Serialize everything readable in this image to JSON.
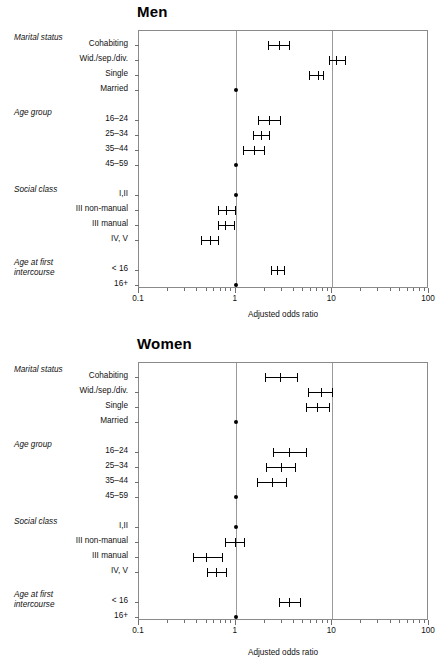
{
  "figure": {
    "axis_title": "Adjusted odds ratio",
    "x_ticklabels": [
      "0.1",
      "1",
      "10",
      "100"
    ],
    "x_tickvalues": [
      0.1,
      1,
      10,
      100
    ],
    "group_labels": {
      "marital": "Marital status",
      "age_group": "Age group",
      "social_class": "Social class",
      "age_first": "Age at first intercourse"
    },
    "row_labels": [
      "Cohabiting",
      "Wid./sep./div.",
      "Single",
      "Married",
      "16–24",
      "25–34",
      "35–44",
      "45–59",
      "I,II",
      "III non-manual",
      "III manual",
      "IV, V",
      "< 16",
      "16+"
    ],
    "colors": {
      "frame": "#8a8a8a",
      "gridline": "#9a9a9a",
      "marker": "#000000",
      "text": "#111111",
      "background": "#ffffff"
    }
  },
  "chart_data": [
    {
      "type": "scatter",
      "title": "Men",
      "xlabel": "Adjusted odds ratio",
      "ylabel": "",
      "xscale": "log",
      "xlim": [
        0.1,
        100
      ],
      "grid": true,
      "gridlines_at": [
        1,
        10
      ],
      "legend": "none",
      "categories": [
        "Cohabiting",
        "Wid./sep./div.",
        "Single",
        "Married",
        "16–24",
        "25–34",
        "35–44",
        "45–59",
        "I,II",
        "III non-manual",
        "III manual",
        "IV, V",
        "< 16",
        "16+"
      ],
      "points": [
        {
          "label": "Cohabiting",
          "group": "Marital status",
          "or": 2.8,
          "ci_low": 2.15,
          "ci_high": 3.55,
          "reference": false
        },
        {
          "label": "Wid./sep./div.",
          "group": "Marital status",
          "or": 11.0,
          "ci_low": 9.2,
          "ci_high": 13.5,
          "reference": false
        },
        {
          "label": "Single",
          "group": "Marital status",
          "or": 7.1,
          "ci_low": 5.7,
          "ci_high": 8.1,
          "reference": false
        },
        {
          "label": "Married",
          "group": "Marital status",
          "or": 1.0,
          "ci_low": 1.0,
          "ci_high": 1.0,
          "reference": true
        },
        {
          "label": "16–24",
          "group": "Age group",
          "or": 2.2,
          "ci_low": 1.7,
          "ci_high": 2.9,
          "reference": false
        },
        {
          "label": "25–34",
          "group": "Age group",
          "or": 1.82,
          "ci_low": 1.5,
          "ci_high": 2.22,
          "reference": false
        },
        {
          "label": "35–44",
          "group": "Age group",
          "or": 1.55,
          "ci_low": 1.18,
          "ci_high": 1.95,
          "reference": false
        },
        {
          "label": "45–59",
          "group": "Age group",
          "or": 1.0,
          "ci_low": 1.0,
          "ci_high": 1.0,
          "reference": true
        },
        {
          "label": "I,II",
          "group": "Social class",
          "or": 1.0,
          "ci_low": 1.0,
          "ci_high": 1.0,
          "reference": true
        },
        {
          "label": "III non-manual",
          "group": "Social class",
          "or": 0.79,
          "ci_low": 0.66,
          "ci_high": 0.99,
          "reference": false
        },
        {
          "label": "III manual",
          "group": "Social class",
          "or": 0.78,
          "ci_low": 0.65,
          "ci_high": 0.96,
          "reference": false
        },
        {
          "label": "IV, V",
          "group": "Social class",
          "or": 0.54,
          "ci_low": 0.44,
          "ci_high": 0.65,
          "reference": false
        },
        {
          "label": "< 16",
          "group": "Age at first intercourse",
          "or": 2.7,
          "ci_low": 2.3,
          "ci_high": 3.2,
          "reference": false
        },
        {
          "label": "16+",
          "group": "Age at first intercourse",
          "or": 1.0,
          "ci_low": 1.0,
          "ci_high": 1.0,
          "reference": true
        }
      ]
    },
    {
      "type": "scatter",
      "title": "Women",
      "xlabel": "Adjusted odds ratio",
      "ylabel": "",
      "xscale": "log",
      "xlim": [
        0.1,
        100
      ],
      "grid": true,
      "gridlines_at": [
        1,
        10
      ],
      "legend": "none",
      "categories": [
        "Cohabiting",
        "Wid./sep./div.",
        "Single",
        "Married",
        "16–24",
        "25–34",
        "35–44",
        "45–59",
        "I,II",
        "III non-manual",
        "III manual",
        "IV, V",
        "< 16",
        "16+"
      ],
      "points": [
        {
          "label": "Cohabiting",
          "group": "Marital status",
          "or": 2.85,
          "ci_low": 2.0,
          "ci_high": 4.3,
          "reference": false
        },
        {
          "label": "Wid./sep./div.",
          "group": "Marital status",
          "or": 7.6,
          "ci_low": 5.6,
          "ci_high": 9.9,
          "reference": false
        },
        {
          "label": "Single",
          "group": "Marital status",
          "or": 7.0,
          "ci_low": 5.3,
          "ci_high": 9.2,
          "reference": false
        },
        {
          "label": "Married",
          "group": "Marital status",
          "or": 1.0,
          "ci_low": 1.0,
          "ci_high": 1.0,
          "reference": true
        },
        {
          "label": "16–24",
          "group": "Age group",
          "or": 3.6,
          "ci_low": 2.45,
          "ci_high": 5.35,
          "reference": false
        },
        {
          "label": "25–34",
          "group": "Age group",
          "or": 2.95,
          "ci_low": 2.05,
          "ci_high": 4.15,
          "reference": false
        },
        {
          "label": "35–44",
          "group": "Age group",
          "or": 2.35,
          "ci_low": 1.65,
          "ci_high": 3.35,
          "reference": false
        },
        {
          "label": "45–59",
          "group": "Age group",
          "or": 1.0,
          "ci_low": 1.0,
          "ci_high": 1.0,
          "reference": true
        },
        {
          "label": "I,II",
          "group": "Social class",
          "or": 1.0,
          "ci_low": 1.0,
          "ci_high": 1.0,
          "reference": true
        },
        {
          "label": "III non-manual",
          "group": "Social class",
          "or": 0.98,
          "ci_low": 0.77,
          "ci_high": 1.22,
          "reference": false
        },
        {
          "label": "III manual",
          "group": "Social class",
          "or": 0.49,
          "ci_low": 0.36,
          "ci_high": 0.72,
          "reference": false
        },
        {
          "label": "IV, V",
          "group": "Social class",
          "or": 0.63,
          "ci_low": 0.51,
          "ci_high": 0.79,
          "reference": false
        },
        {
          "label": "< 16",
          "group": "Age at first intercourse",
          "or": 3.6,
          "ci_low": 2.8,
          "ci_high": 4.6,
          "reference": false
        },
        {
          "label": "16+",
          "group": "Age at first intercourse",
          "or": 1.0,
          "ci_low": 1.0,
          "ci_high": 1.0,
          "reference": true
        }
      ]
    }
  ]
}
